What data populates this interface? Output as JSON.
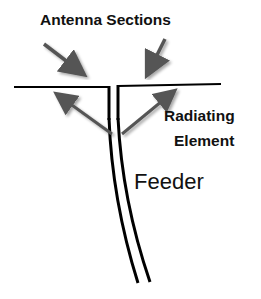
{
  "diagram": {
    "type": "antenna-diagram",
    "labels": {
      "antenna_sections": "Antenna Sections",
      "radiating_line1": "Radiating",
      "radiating_line2": "Element",
      "feeder": "Feeder"
    },
    "colors": {
      "conductor": "#000000",
      "arrow": "#555555",
      "text": "#111111",
      "background": "#ffffff"
    }
  }
}
